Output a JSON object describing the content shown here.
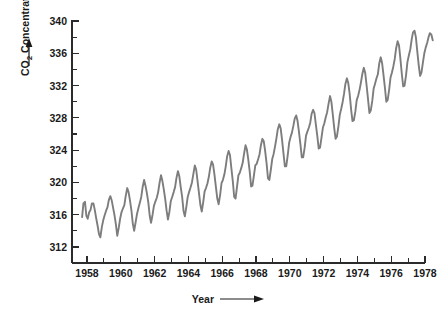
{
  "chart_data": {
    "type": "line",
    "title": "",
    "subtitle": "",
    "xlabel": "Year",
    "ylabel": "CO2 Concentration (parts per million)",
    "ylabel_display": "CO₂ Concentration (parts per million)",
    "xlabel_arrow": true,
    "ylabel_arrow": true,
    "grid": false,
    "legend": "none",
    "xlim": [
      1957.4,
      1978.6
    ],
    "ylim": [
      310.0,
      340.5
    ],
    "axis_draw_range_y": [
      312,
      340
    ],
    "axis_draw_range_x": [
      1958,
      1978
    ],
    "xticks_major": [
      1958,
      1960,
      1962,
      1964,
      1966,
      1968,
      1970,
      1972,
      1974,
      1976,
      1978
    ],
    "xticks_major_labels": [
      "1958",
      "1960",
      "1962",
      "1964",
      "1966",
      "1968",
      "1970",
      "1972",
      "1974",
      "1976",
      "1978"
    ],
    "xticks_minor": [
      1959,
      1961,
      1963,
      1965,
      1967,
      1969,
      1971,
      1973,
      1975,
      1977
    ],
    "yticks_major": [
      312,
      316,
      320,
      324,
      328,
      332,
      336,
      340
    ],
    "yticks_major_labels": [
      "312",
      "316",
      "320",
      "324",
      "328",
      "332",
      "336",
      "340"
    ],
    "yticks_minor": [
      314,
      318,
      322,
      326,
      330,
      334,
      338
    ],
    "series_name": "Mauna Loa monthly mean CO2",
    "series_color": "#7d7d7d",
    "axis_color": "#2b2b2b",
    "text_color": "#1a1a1a",
    "background_color": "#ffffff",
    "x": [
      1957.71,
      1957.79,
      1957.88,
      1957.96,
      1958.04,
      1958.13,
      1958.21,
      1958.29,
      1958.38,
      1958.46,
      1958.54,
      1958.63,
      1958.71,
      1958.79,
      1958.88,
      1958.96,
      1959.04,
      1959.13,
      1959.21,
      1959.29,
      1959.38,
      1959.46,
      1959.54,
      1959.63,
      1959.71,
      1959.79,
      1959.88,
      1959.96,
      1960.04,
      1960.13,
      1960.21,
      1960.29,
      1960.38,
      1960.46,
      1960.54,
      1960.63,
      1960.71,
      1960.79,
      1960.88,
      1960.96,
      1961.04,
      1961.13,
      1961.21,
      1961.29,
      1961.38,
      1961.46,
      1961.54,
      1961.63,
      1961.71,
      1961.79,
      1961.88,
      1961.96,
      1962.04,
      1962.13,
      1962.21,
      1962.29,
      1962.38,
      1962.46,
      1962.54,
      1962.63,
      1962.71,
      1962.79,
      1962.88,
      1962.96,
      1963.04,
      1963.13,
      1963.21,
      1963.29,
      1963.38,
      1963.46,
      1963.54,
      1963.63,
      1963.71,
      1963.79,
      1963.88,
      1963.96,
      1964.04,
      1964.13,
      1964.21,
      1964.29,
      1964.38,
      1964.46,
      1964.54,
      1964.63,
      1964.71,
      1964.79,
      1964.88,
      1964.96,
      1965.04,
      1965.13,
      1965.21,
      1965.29,
      1965.38,
      1965.46,
      1965.54,
      1965.63,
      1965.71,
      1965.79,
      1965.88,
      1965.96,
      1966.04,
      1966.13,
      1966.21,
      1966.29,
      1966.38,
      1966.46,
      1966.54,
      1966.63,
      1966.71,
      1966.79,
      1966.88,
      1966.96,
      1967.04,
      1967.13,
      1967.21,
      1967.29,
      1967.38,
      1967.46,
      1967.54,
      1967.63,
      1967.71,
      1967.79,
      1967.88,
      1967.96,
      1968.04,
      1968.13,
      1968.21,
      1968.29,
      1968.38,
      1968.46,
      1968.54,
      1968.63,
      1968.71,
      1968.79,
      1968.88,
      1968.96,
      1969.04,
      1969.13,
      1969.21,
      1969.29,
      1969.38,
      1969.46,
      1969.54,
      1969.63,
      1969.71,
      1969.79,
      1969.88,
      1969.96,
      1970.04,
      1970.13,
      1970.21,
      1970.29,
      1970.38,
      1970.46,
      1970.54,
      1970.63,
      1970.71,
      1970.79,
      1970.88,
      1970.96,
      1971.04,
      1971.13,
      1971.21,
      1971.29,
      1971.38,
      1971.46,
      1971.54,
      1971.63,
      1971.71,
      1971.79,
      1971.88,
      1971.96,
      1972.04,
      1972.13,
      1972.21,
      1972.29,
      1972.38,
      1972.46,
      1972.54,
      1972.63,
      1972.71,
      1972.79,
      1972.88,
      1972.96,
      1973.04,
      1973.13,
      1973.21,
      1973.29,
      1973.38,
      1973.46,
      1973.54,
      1973.63,
      1973.71,
      1973.79,
      1973.88,
      1973.96,
      1974.04,
      1974.13,
      1974.21,
      1974.29,
      1974.38,
      1974.46,
      1974.54,
      1974.63,
      1974.71,
      1974.79,
      1974.88,
      1974.96,
      1975.04,
      1975.13,
      1975.21,
      1975.29,
      1975.38,
      1975.46,
      1975.54,
      1975.63,
      1975.71,
      1975.79,
      1975.88,
      1975.96,
      1976.04,
      1976.13,
      1976.21,
      1976.29,
      1976.38,
      1976.46,
      1976.54,
      1976.63,
      1976.71,
      1976.79,
      1976.88,
      1976.96,
      1977.04,
      1977.13,
      1977.21,
      1977.29,
      1977.38,
      1977.46,
      1977.54,
      1977.63,
      1977.71,
      1977.79,
      1977.88,
      1977.96,
      1978.04,
      1978.13,
      1978.21,
      1978.29,
      1978.38,
      1978.46
    ],
    "y": [
      315.7,
      317.4,
      317.6,
      315.9,
      315.5,
      316.3,
      316.6,
      317.4,
      317.4,
      316.6,
      315.6,
      314.6,
      313.6,
      313.2,
      314.5,
      315.3,
      315.9,
      316.5,
      316.9,
      317.8,
      318.3,
      317.8,
      316.9,
      315.9,
      314.8,
      313.4,
      314.4,
      315.5,
      316.3,
      316.8,
      317.2,
      318.3,
      319.3,
      318.8,
      317.8,
      316.5,
      314.9,
      314.0,
      315.1,
      316.1,
      316.8,
      317.5,
      318.2,
      319.4,
      320.3,
      319.6,
      318.7,
      317.5,
      315.9,
      315.0,
      316.0,
      317.1,
      317.6,
      318.1,
      318.8,
      319.9,
      320.9,
      320.2,
      319.2,
      317.9,
      316.5,
      315.4,
      316.4,
      317.7,
      318.2,
      318.8,
      319.4,
      320.5,
      321.4,
      320.8,
      319.5,
      318.2,
      316.5,
      315.8,
      317.0,
      318.2,
      318.8,
      319.4,
      320.0,
      321.0,
      322.1,
      321.6,
      320.2,
      318.6,
      317.2,
      316.4,
      317.6,
      318.9,
      319.3,
      319.9,
      320.7,
      321.8,
      322.6,
      322.2,
      321.0,
      319.4,
      318.0,
      317.3,
      318.5,
      319.9,
      320.3,
      321.0,
      322.0,
      323.2,
      323.9,
      323.4,
      321.8,
      320.1,
      318.2,
      318.0,
      319.5,
      320.9,
      321.2,
      321.8,
      322.4,
      323.5,
      324.6,
      324.1,
      322.9,
      321.3,
      319.5,
      319.6,
      320.9,
      322.1,
      322.3,
      322.9,
      323.5,
      324.6,
      325.4,
      325.1,
      323.9,
      322.3,
      320.5,
      320.3,
      321.6,
      322.9,
      323.5,
      324.5,
      325.5,
      326.6,
      327.2,
      326.7,
      325.3,
      323.5,
      322.0,
      322.0,
      323.4,
      324.9,
      325.6,
      326.2,
      327.0,
      327.9,
      328.3,
      327.6,
      326.3,
      324.7,
      323.1,
      323.1,
      324.3,
      325.8,
      326.3,
      326.8,
      327.4,
      328.5,
      329.0,
      328.6,
      327.2,
      325.7,
      324.2,
      324.3,
      325.6,
      326.8,
      327.3,
      328.1,
      328.7,
      329.7,
      330.7,
      330.0,
      328.5,
      326.7,
      325.4,
      325.7,
      327.0,
      328.4,
      329.1,
      330.0,
      331.0,
      332.2,
      332.9,
      332.3,
      331.0,
      329.0,
      327.6,
      327.7,
      328.8,
      330.2,
      330.7,
      331.5,
      332.4,
      333.4,
      334.2,
      333.6,
      332.1,
      330.3,
      328.6,
      328.9,
      330.1,
      331.6,
      332.2,
      332.9,
      333.4,
      334.7,
      335.5,
      334.8,
      333.4,
      331.7,
      330.0,
      330.2,
      331.5,
      333.0,
      333.6,
      334.4,
      335.3,
      336.6,
      337.5,
      337.0,
      335.4,
      333.4,
      331.9,
      332.0,
      333.3,
      334.9,
      335.7,
      336.5,
      337.7,
      338.6,
      338.8,
      338.0,
      336.3,
      334.5,
      333.2,
      333.6,
      334.9,
      336.0,
      336.7,
      337.3,
      338.0,
      338.5,
      338.3,
      337.6
    ]
  },
  "axes": {
    "x_axis_name": "year-axis",
    "y_axis_name": "co2-axis"
  }
}
